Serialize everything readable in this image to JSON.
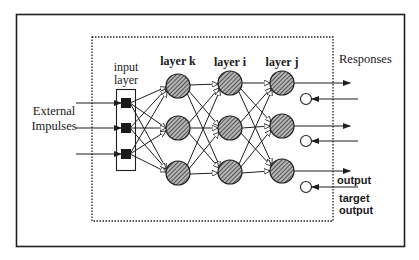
{
  "figure": {
    "labels": {
      "external_impulses_line1": "External",
      "external_impulses_line2": "Impulses",
      "input_layer_line1": "input",
      "input_layer_line2": "layer",
      "layer_k": "layer k",
      "layer_i": "layer i",
      "layer_j": "layer j",
      "responses": "Responses",
      "output": "output",
      "target_output_line1": "target",
      "target_output_line2": "output"
    },
    "colors": {
      "stroke": "#1f1f1f",
      "node_fill": "#8a8a8a",
      "hatch": "#2a2a2a",
      "background": "#ffffff"
    },
    "structure": {
      "input_nodes": 3,
      "layer_k_nodes": 3,
      "layer_i_nodes": 3,
      "layer_j_nodes": 3,
      "target_nodes": 3,
      "connectivity": "fully-connected feedforward"
    }
  }
}
